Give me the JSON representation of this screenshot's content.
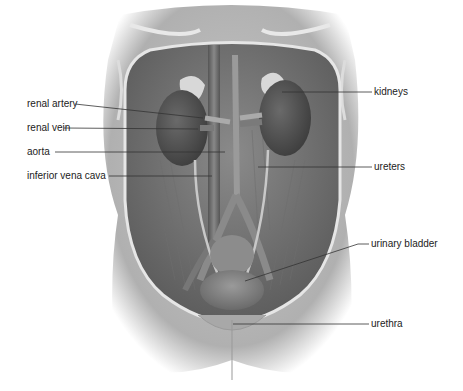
{
  "diagram": {
    "labels_left": [
      {
        "id": "renal-artery",
        "text": "renal artery",
        "x": 27,
        "y": 98,
        "line": [
          75,
          104,
          203,
          118
        ]
      },
      {
        "id": "renal-vein",
        "text": "renal vein",
        "x": 27,
        "y": 122,
        "line": [
          64,
          128,
          198,
          129
        ]
      },
      {
        "id": "aorta",
        "text": "aorta",
        "x": 27,
        "y": 146,
        "line": [
          55,
          152,
          225,
          152
        ]
      },
      {
        "id": "inferior-vena-cava",
        "text": "inferior vena cava",
        "x": 27,
        "y": 170,
        "line": [
          109,
          176,
          212,
          176
        ]
      }
    ],
    "labels_right": [
      {
        "id": "kidneys",
        "text": "kidneys",
        "x": 374,
        "y": 86,
        "line": [
          282,
          92,
          372,
          92
        ]
      },
      {
        "id": "ureters",
        "text": "ureters",
        "x": 374,
        "y": 161,
        "line": [
          258,
          167,
          372,
          167
        ]
      },
      {
        "id": "urinary-bladder",
        "text": "urinary bladder",
        "x": 371,
        "y": 238,
        "line": [
          245,
          281,
          358,
          244,
          369,
          244
        ]
      },
      {
        "id": "urethra",
        "text": "urethra",
        "x": 371,
        "y": 318,
        "line": [
          233,
          324,
          369,
          324
        ]
      }
    ]
  }
}
